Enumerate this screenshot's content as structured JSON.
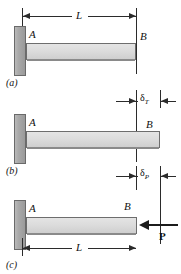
{
  "figure": {
    "colors": {
      "background": "#ffffff",
      "wall_fill": "#a9a9a9",
      "wall_stroke": "#6a6a6a",
      "bar_fill": "#dcdcdc",
      "bar_stroke": "#6d6d6d",
      "line": "#2b2b2b",
      "force": "#1c1c1c",
      "text": "#111111"
    }
  },
  "panels": [
    {
      "id": "a",
      "label": "(a)",
      "point_left": "A",
      "point_right": "B",
      "dimension": "L",
      "description": "Bar of original length L fixed at A, free end at B"
    },
    {
      "id": "b",
      "label": "(b)",
      "point_left": "A",
      "point_right": "B",
      "delta_symbol": "δ",
      "delta_subscript": "T",
      "description": "Bar elongated by thermal expansion delta sub T"
    },
    {
      "id": "c",
      "label": "(c)",
      "point_left": "A",
      "point_right": "B",
      "delta_symbol": "δ",
      "delta_subscript": "P",
      "dimension": "L",
      "force": "P",
      "description": "Bar shortened by compressive axial load P producing delta sub P"
    }
  ]
}
